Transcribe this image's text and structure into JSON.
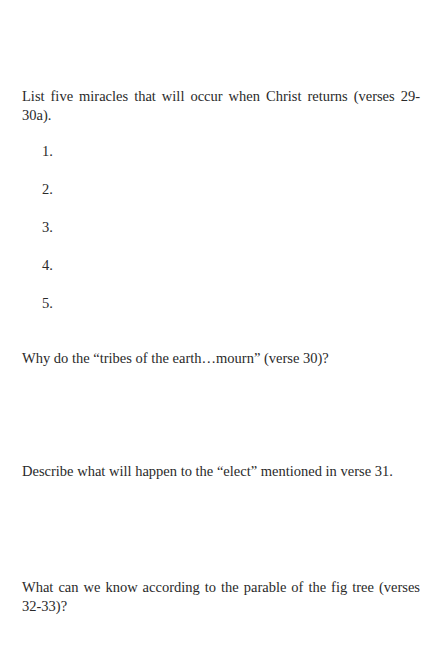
{
  "questions": [
    {
      "text": "List five miracles that will occur when Christ returns (verses 29-30a)."
    },
    {
      "text": "Why do the “tribes of the earth…mourn” (verse 30)?"
    },
    {
      "text": "Describe what will happen to the “elect” mentioned in verse 31."
    },
    {
      "text": "What can we know according to the parable of the fig tree (verses 32-33)?"
    }
  ],
  "list_numbers": [
    "1.",
    "2.",
    "3.",
    "4.",
    "5."
  ]
}
